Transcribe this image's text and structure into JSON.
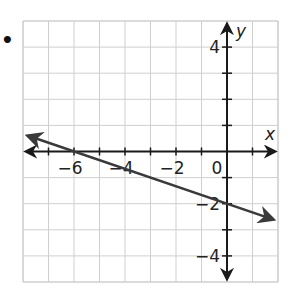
{
  "bullet_marker": "•",
  "chart_data": {
    "type": "line",
    "title": "",
    "xlabel": "x",
    "ylabel": "y",
    "xlim": [
      -8,
      2
    ],
    "ylim": [
      -5,
      5
    ],
    "grid": true,
    "grid_step": 1,
    "x_tick_labels": [
      {
        "value": -6,
        "label": "−6"
      },
      {
        "value": -4,
        "label": "−4"
      },
      {
        "value": -2,
        "label": "−2"
      },
      {
        "value": 0,
        "label": "0"
      }
    ],
    "y_tick_labels": [
      {
        "value": 4,
        "label": "4"
      },
      {
        "value": -2,
        "label": "−2"
      },
      {
        "value": -4,
        "label": "−4"
      }
    ],
    "series": [
      {
        "name": "line",
        "equation": "y = -1/3 x - 2",
        "slope": -0.3333,
        "y_intercept": -2,
        "x_intercept": -6,
        "points": [
          {
            "x": -7.8,
            "y": 0.6
          },
          {
            "x": -6,
            "y": 0
          },
          {
            "x": 0,
            "y": -2
          },
          {
            "x": 1.8,
            "y": -2.6
          }
        ],
        "arrows_both_ends": true,
        "color": "#3a3a3a"
      }
    ],
    "colors": {
      "grid": "#cfcfcf",
      "axes": "#1a1a1a",
      "line": "#3a3a3a"
    }
  }
}
